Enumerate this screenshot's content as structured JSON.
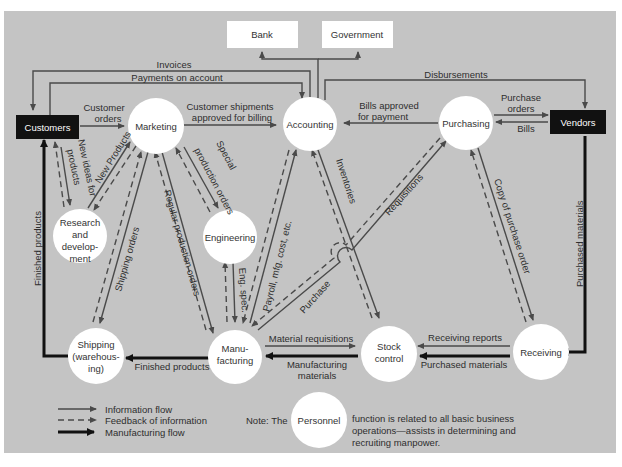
{
  "external_boxes": {
    "bank": "Bank",
    "government": "Government",
    "customers": "Customers",
    "vendors": "Vendors"
  },
  "nodes": {
    "marketing": [
      "Marketing"
    ],
    "accounting": [
      "Accounting"
    ],
    "purchasing": [
      "Purchasing"
    ],
    "research": [
      "Research",
      "and",
      "develop-",
      "ment"
    ],
    "engineering": [
      "Engineering"
    ],
    "shipping": [
      "Shipping",
      "(warehous-",
      "ing)"
    ],
    "manufacturing": [
      "Manu-",
      "facturing"
    ],
    "stock_control": [
      "Stock",
      "control"
    ],
    "receiving": [
      "Receiving"
    ],
    "personnel": [
      "Personnel"
    ]
  },
  "flow_labels": {
    "invoices": "Invoices",
    "payments_on_account": "Payments on account",
    "disbursements": "Disbursements",
    "customer_orders": [
      "Customer",
      "orders"
    ],
    "customer_shipments": [
      "Customer shipments",
      "approved for billing"
    ],
    "bills_approved": [
      "Bills approved",
      "for payment"
    ],
    "purchase_orders": [
      "Purchase",
      "orders"
    ],
    "bills": "Bills",
    "new_ideas": [
      "New ideas for",
      "products"
    ],
    "new_products": "New Products",
    "special_production": [
      "Special",
      "production orders"
    ],
    "regular_production": "Regular production orders",
    "shipping_orders": "Shipping orders",
    "finished_products_vertical": "Finished products",
    "eng_spec": "Eng. spec.",
    "payroll": "Payroll, mfg. cost, etc.",
    "inventories": "Inventories",
    "requisitions": "Requisitions",
    "purchase": "Purchase",
    "copy_purchase_order": "Copy of purchase order",
    "purchased_materials_vertical": "Purchased materials",
    "material_requisitions": "Material requisitions",
    "manufacturing_materials": [
      "Manufacturing",
      "materials"
    ],
    "finished_products": "Finished products",
    "receiving_reports": "Receiving reports",
    "purchased_materials": "Purchased materials"
  },
  "legend": {
    "information_flow": "Information flow",
    "feedback": "Feedback of information",
    "manufacturing_flow": "Manufacturing flow"
  },
  "note": {
    "prefix": "Note: The",
    "lines": [
      "function is related to all basic business",
      "operations—assists in determining and",
      "recruiting manpower."
    ]
  },
  "colors": {
    "background": "#c4c4c4",
    "node_fill": "#ffffff",
    "external_dark": "#111111",
    "line": "#4a4a4a",
    "thick_line": "#111111"
  }
}
